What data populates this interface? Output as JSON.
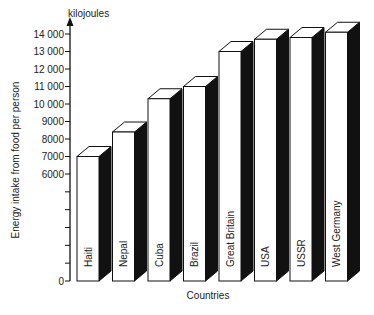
{
  "chart_data": {
    "type": "bar",
    "style": "3d-column",
    "title": "",
    "xlabel": "Countries",
    "ylabel": "Energy intake from food per person",
    "y_unit_label": "kilojoules",
    "categories": [
      "Haiti",
      "Nepal",
      "Cuba",
      "Brazil",
      "Great Britain",
      "USA",
      "USSR",
      "West Germany"
    ],
    "values": [
      7000,
      8400,
      10300,
      11000,
      13000,
      13700,
      13800,
      14100
    ],
    "y_ticks": [
      {
        "value": 0,
        "label": "0"
      },
      {
        "value": 6000,
        "label": "6000"
      },
      {
        "value": 7000,
        "label": "7000"
      },
      {
        "value": 8000,
        "label": "8000"
      },
      {
        "value": 9000,
        "label": "9000"
      },
      {
        "value": 10000,
        "label": "10 000"
      },
      {
        "value": 11000,
        "label": "11 000"
      },
      {
        "value": 12000,
        "label": "12 000"
      },
      {
        "value": 13000,
        "label": "13 000"
      },
      {
        "value": 14000,
        "label": "14 000"
      }
    ],
    "y_axis_break": {
      "from": 0,
      "to": 6000,
      "unlabeled_ticks": 5
    },
    "ylim": [
      0,
      14000
    ],
    "grid": false,
    "legend": null,
    "colors": {
      "front": "#ffffff",
      "side": "#111111",
      "top": "#ffffff",
      "outline": "#111111"
    }
  }
}
